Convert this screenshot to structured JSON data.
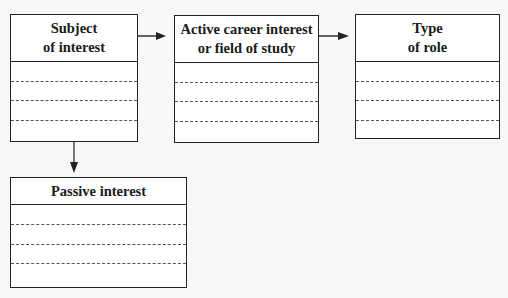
{
  "diagram": {
    "boxes": [
      {
        "id": "subject-of-interest",
        "title_line1": "Subject",
        "title_line2": "of interest",
        "rows": 4
      },
      {
        "id": "active-career-interest",
        "title_line1": "Active career interest",
        "title_line2": "or field of study",
        "rows": 4
      },
      {
        "id": "type-of-role",
        "title_line1": "Type",
        "title_line2": "of role",
        "rows": 4
      },
      {
        "id": "passive-interest",
        "title_line1": "Passive interest",
        "title_line2": "",
        "rows": 4
      }
    ],
    "connections": [
      {
        "from": "subject-of-interest",
        "to": "active-career-interest",
        "direction": "right"
      },
      {
        "from": "active-career-interest",
        "to": "type-of-role",
        "direction": "right"
      },
      {
        "from": "subject-of-interest",
        "to": "passive-interest",
        "direction": "down"
      }
    ],
    "colors": {
      "stroke": "#222222",
      "background": "#f7f7f5",
      "box_fill": "#ffffff"
    }
  }
}
